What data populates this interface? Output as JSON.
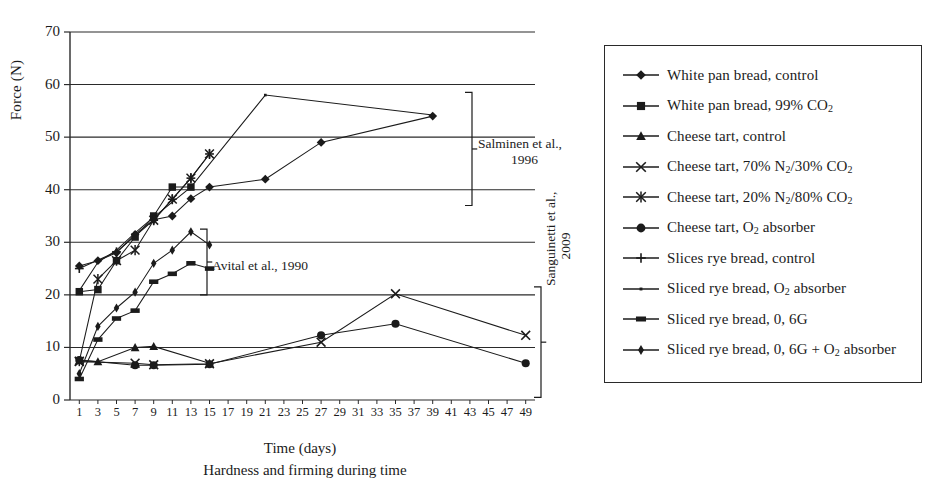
{
  "chart_data": {
    "type": "line",
    "title": "Hardness and firming during time",
    "xlabel": "Time (days)",
    "ylabel": "Force (N)",
    "xlim": [
      0,
      50
    ],
    "ylim": [
      0,
      70
    ],
    "ytick_step": 10,
    "yticks": [
      0,
      10,
      20,
      30,
      40,
      50,
      60,
      70
    ],
    "xticks": [
      1,
      3,
      5,
      7,
      9,
      11,
      13,
      15,
      17,
      19,
      21,
      23,
      25,
      27,
      29,
      31,
      33,
      35,
      37,
      39,
      41,
      43,
      45,
      47,
      49
    ],
    "grid": "horizontal",
    "legend_position": "right-outside",
    "series": [
      {
        "name": "White pan bread, control",
        "marker": "diamond",
        "points": [
          [
            1,
            25.5
          ],
          [
            3,
            26.5
          ],
          [
            5,
            28.0
          ],
          [
            7,
            31.5
          ],
          [
            9,
            34.3
          ],
          [
            11,
            35.0
          ],
          [
            13,
            38.3
          ],
          [
            15,
            40.5
          ],
          [
            21,
            42.0
          ],
          [
            27,
            49.0
          ],
          [
            39,
            54.0
          ]
        ]
      },
      {
        "name": "White pan bread, 99% CO2",
        "marker": "square",
        "points": [
          [
            1,
            20.6
          ],
          [
            3,
            21.0
          ],
          [
            5,
            26.5
          ],
          [
            7,
            31.0
          ],
          [
            9,
            35.0
          ],
          [
            11,
            40.5
          ],
          [
            13,
            40.5
          ]
        ]
      },
      {
        "name": "Cheese tart, control",
        "marker": "triangle",
        "points": [
          [
            1,
            7.5
          ],
          [
            3,
            7.3
          ],
          [
            7,
            10.0
          ],
          [
            9,
            10.2
          ],
          [
            15,
            7.0
          ]
        ]
      },
      {
        "name": "Cheese tart, 70% N2/30% CO2",
        "marker": "cross-x",
        "points": [
          [
            1,
            7.3
          ],
          [
            7,
            7.0
          ],
          [
            9,
            6.7
          ],
          [
            15,
            6.9
          ],
          [
            27,
            11.0
          ],
          [
            35,
            20.2
          ],
          [
            49,
            12.3
          ]
        ]
      },
      {
        "name": "Cheese tart, 20% N2/80% CO2",
        "marker": "asterisk",
        "points": [
          [
            1,
            7.4
          ],
          [
            3,
            23.0
          ],
          [
            5,
            26.5
          ],
          [
            7,
            28.5
          ],
          [
            9,
            34.2
          ],
          [
            11,
            38.2
          ],
          [
            13,
            42.2
          ],
          [
            15,
            46.8
          ]
        ]
      },
      {
        "name": "Cheese tart, O2 absorber",
        "marker": "circle",
        "points": [
          [
            1,
            7.6
          ],
          [
            7,
            6.6
          ],
          [
            9,
            6.6
          ],
          [
            15,
            6.8
          ],
          [
            27,
            12.3
          ],
          [
            35,
            14.5
          ],
          [
            49,
            7.0
          ]
        ]
      },
      {
        "name": "Slices rye bread, control",
        "marker": "plus",
        "points": [
          [
            1,
            25.0
          ],
          [
            5,
            28.2
          ],
          [
            9,
            34.2
          ],
          [
            11,
            38.2
          ],
          [
            13,
            42.2
          ],
          [
            15,
            46.8
          ]
        ]
      },
      {
        "name": "Sliced rye bread, O2 absorber",
        "marker": "line-dot",
        "points": [
          [
            1,
            20.8
          ],
          [
            3,
            26.2
          ],
          [
            5,
            28.5
          ],
          [
            7,
            31.8
          ],
          [
            9,
            34.8
          ],
          [
            13,
            40.5
          ],
          [
            21,
            58.0
          ],
          [
            39,
            54.2
          ]
        ]
      },
      {
        "name": "Sliced rye bread, 0, 6G",
        "marker": "thick-dash",
        "points": [
          [
            1,
            4.0
          ],
          [
            3,
            11.5
          ],
          [
            5,
            15.5
          ],
          [
            7,
            17.0
          ],
          [
            9,
            22.5
          ],
          [
            11,
            24.0
          ],
          [
            13,
            26.0
          ],
          [
            15,
            25.0
          ]
        ]
      },
      {
        "name": "Sliced rye bread, 0, 6G + O2 absorber",
        "marker": "small-diamond",
        "points": [
          [
            1,
            5.0
          ],
          [
            3,
            14.0
          ],
          [
            5,
            17.5
          ],
          [
            7,
            20.5
          ],
          [
            9,
            26.0
          ],
          [
            11,
            28.5
          ],
          [
            13,
            32.0
          ],
          [
            15,
            29.5
          ]
        ]
      }
    ],
    "annotations": [
      {
        "id": "salminen",
        "line1": "Salminen et al.,",
        "line2": "1996",
        "bracket_range": [
          37,
          58
        ]
      },
      {
        "id": "avital",
        "line1": "Avital et al., 1990",
        "line2": "",
        "bracket_range": [
          20,
          32
        ]
      },
      {
        "id": "sanguinetti",
        "line1": "Sanguinetti et al.,",
        "line2": "2009",
        "bracket_range": [
          0,
          21
        ]
      }
    ]
  },
  "legend": {
    "items": [
      {
        "label": "White pan bread, control",
        "marker": "diamond",
        "sub": ""
      },
      {
        "label": "White pan bread, 99% CO",
        "marker": "square",
        "sub": "2"
      },
      {
        "label": "Cheese tart, control",
        "marker": "triangle",
        "sub": ""
      },
      {
        "label": "Cheese tart, 70% N",
        "marker": "cross-x",
        "sub": "2",
        "label2": "/30% CO",
        "sub2": "2"
      },
      {
        "label": "Cheese tart, 20% N",
        "marker": "asterisk",
        "sub": "2",
        "label2": "/80% CO",
        "sub2": "2"
      },
      {
        "label": "Cheese tart, O",
        "marker": "circle",
        "sub": "2",
        "label2": " absorber"
      },
      {
        "label": "Slices rye bread, control",
        "marker": "plus",
        "sub": ""
      },
      {
        "label": "Sliced rye bread, O",
        "marker": "line-dot",
        "sub": "2",
        "label2": " absorber"
      },
      {
        "label": "Sliced rye bread, 0, 6G",
        "marker": "thick-dash",
        "sub": ""
      },
      {
        "label": "Sliced rye bread, 0, 6G + O",
        "marker": "small-diamond",
        "sub": "2",
        "label2": " absorber"
      }
    ]
  },
  "colors": {
    "ink": "#1b1b1b",
    "grid": "#2a2a2a",
    "background": "#ffffff"
  }
}
